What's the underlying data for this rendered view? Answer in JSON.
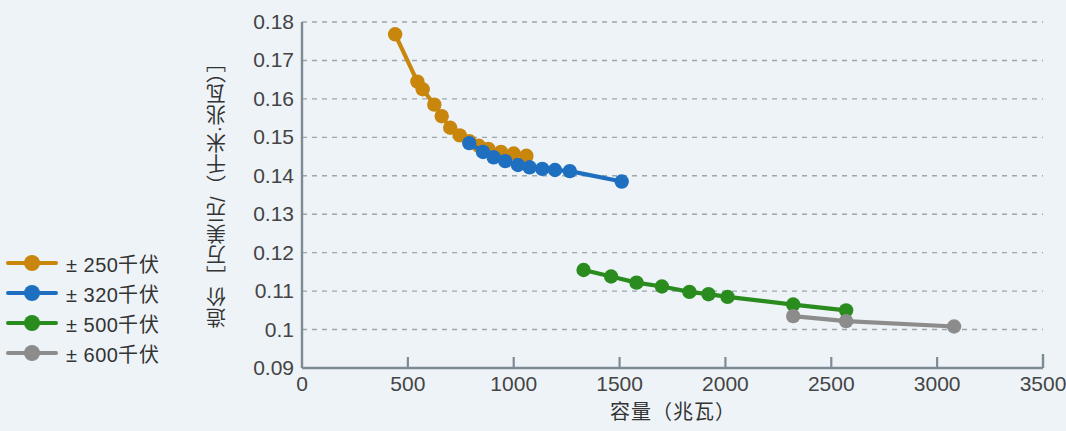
{
  "chart_data": {
    "type": "line",
    "title": "",
    "xlabel": "容量（兆瓦）",
    "ylabel": "造价［万美元/（千米·兆瓦）］",
    "xlim": [
      0,
      3500
    ],
    "ylim": [
      0.09,
      0.18
    ],
    "xticks": [
      "0",
      "500",
      "1000",
      "1500",
      "2000",
      "2500",
      "3000",
      "3500"
    ],
    "yticks": [
      "0.09",
      "0.1",
      "0.11",
      "0.12",
      "0.13",
      "0.14",
      "0.15",
      "0.16",
      "0.17",
      "0.18"
    ],
    "grid": "horizontal-dashed",
    "legend_position": "left-outside",
    "series": [
      {
        "name": "± 250千伏",
        "color": "#c8860d",
        "points": [
          [
            440,
            0.1768
          ],
          [
            545,
            0.1645
          ],
          [
            570,
            0.1625
          ],
          [
            625,
            0.1585
          ],
          [
            660,
            0.1555
          ],
          [
            700,
            0.1525
          ],
          [
            745,
            0.1505
          ],
          [
            790,
            0.149
          ],
          [
            835,
            0.1478
          ],
          [
            880,
            0.147
          ],
          [
            940,
            0.1462
          ],
          [
            1000,
            0.1458
          ],
          [
            1060,
            0.1452
          ]
        ]
      },
      {
        "name": "± 320千伏",
        "color": "#1f6fc0",
        "points": [
          [
            790,
            0.1485
          ],
          [
            855,
            0.1462
          ],
          [
            905,
            0.1448
          ],
          [
            960,
            0.1438
          ],
          [
            1020,
            0.1428
          ],
          [
            1075,
            0.1422
          ],
          [
            1135,
            0.1418
          ],
          [
            1195,
            0.1415
          ],
          [
            1265,
            0.1412
          ],
          [
            1510,
            0.1385
          ]
        ]
      },
      {
        "name": "± 500千伏",
        "color": "#2a8c1f",
        "points": [
          [
            1330,
            0.1155
          ],
          [
            1460,
            0.1138
          ],
          [
            1580,
            0.1122
          ],
          [
            1700,
            0.1112
          ],
          [
            1830,
            0.1098
          ],
          [
            1920,
            0.1092
          ],
          [
            2010,
            0.1085
          ],
          [
            2320,
            0.1065
          ],
          [
            2570,
            0.105
          ]
        ]
      },
      {
        "name": "± 600千伏",
        "color": "#8c8c8c",
        "points": [
          [
            2320,
            0.1035
          ],
          [
            2570,
            0.1022
          ],
          [
            3080,
            0.1008
          ]
        ]
      }
    ]
  },
  "legend": {
    "items": [
      {
        "label": "± 250千伏",
        "color": "#c8860d",
        "marker": "circle-line-marker"
      },
      {
        "label": "± 320千伏",
        "color": "#1f6fc0",
        "marker": "circle-line-marker"
      },
      {
        "label": "± 500千伏",
        "color": "#2a8c1f",
        "marker": "circle-line-marker"
      },
      {
        "label": "± 600千伏",
        "color": "#8c8c8c",
        "marker": "circle-line-marker"
      }
    ]
  },
  "axes": {
    "x_title": "容量（兆瓦）",
    "y_title": "造价［万美元/（千米·兆瓦）］"
  },
  "colors": {
    "background": "#edf3f7",
    "axis": "#7e8b94",
    "grid": "#8d99a2",
    "text": "#333333"
  }
}
